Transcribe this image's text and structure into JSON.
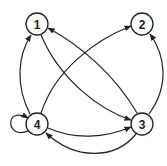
{
  "diagram": {
    "type": "directed-graph",
    "nodes": [
      {
        "id": "1",
        "label": "1"
      },
      {
        "id": "2",
        "label": "2"
      },
      {
        "id": "3",
        "label": "3"
      },
      {
        "id": "4",
        "label": "4"
      }
    ],
    "edges": [
      {
        "from": "1",
        "to": "3"
      },
      {
        "from": "3",
        "to": "1"
      },
      {
        "from": "4",
        "to": "1"
      },
      {
        "from": "4",
        "to": "2"
      },
      {
        "from": "3",
        "to": "2"
      },
      {
        "from": "4",
        "to": "3"
      },
      {
        "from": "3",
        "to": "4"
      },
      {
        "from": "4",
        "to": "4"
      }
    ],
    "colors": {
      "stroke": "#222222",
      "node_fill": "#ffffff"
    }
  }
}
